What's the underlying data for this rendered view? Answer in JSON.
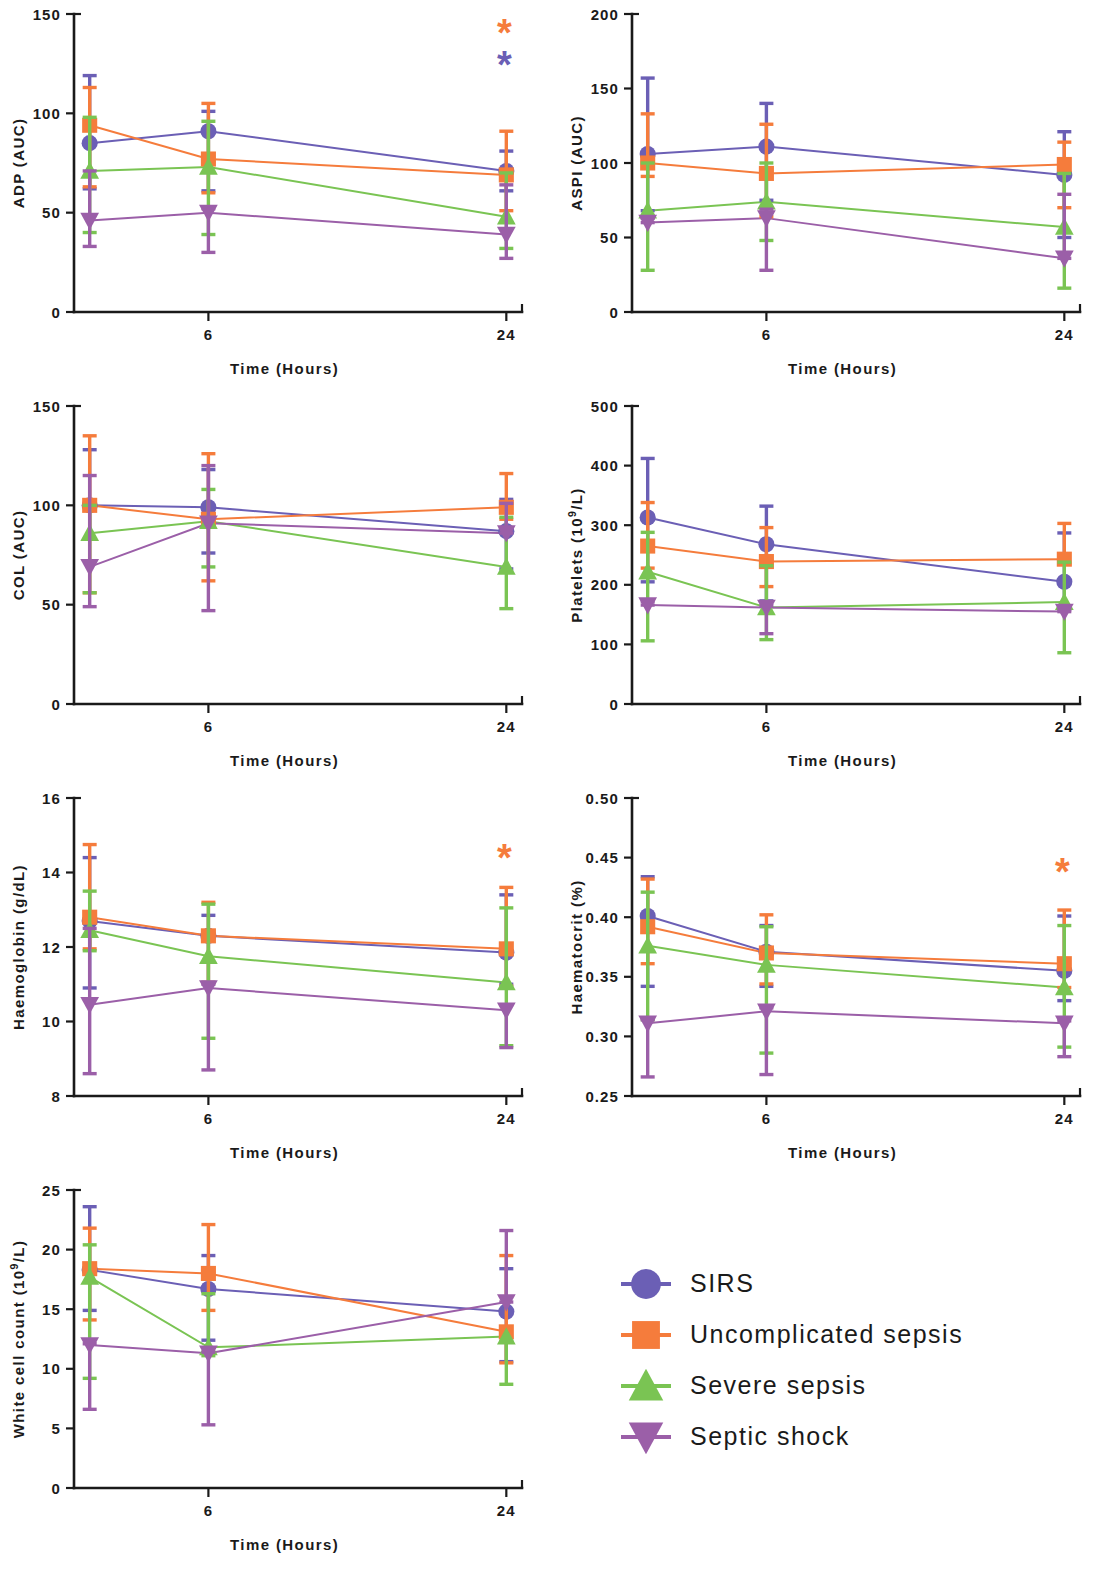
{
  "figure": {
    "panel_count": 7,
    "x_axis_title": "Time (Hours)",
    "x_tick_labels": [
      "6",
      "24"
    ]
  },
  "series_meta": [
    {
      "key": "sirs",
      "name": "SIRS",
      "color": "#6b5fb5",
      "marker": "circle"
    },
    {
      "key": "uncomplicated",
      "name": "Uncomplicated sepsis",
      "color": "#f57c3c",
      "marker": "square"
    },
    {
      "key": "severe",
      "name": "Severe sepsis",
      "color": "#7ac453",
      "marker": "triangle-up"
    },
    {
      "key": "shock",
      "name": "Septic shock",
      "color": "#9b5fa8",
      "marker": "triangle-down"
    }
  ],
  "legend": {
    "items": [
      {
        "label": "SIRS",
        "color": "#6b5fb5",
        "marker": "circle"
      },
      {
        "label": "Uncomplicated sepsis",
        "color": "#f57c3c",
        "marker": "square"
      },
      {
        "label": "Severe sepsis",
        "color": "#7ac453",
        "marker": "triangle-up"
      },
      {
        "label": "Septic shock",
        "color": "#9b5fa8",
        "marker": "triangle-down"
      }
    ]
  },
  "chart_data": [
    {
      "id": "adp",
      "type": "line",
      "position": {
        "left": 0,
        "top": 0
      },
      "title": "",
      "ylabel": "ADP (AUC)",
      "xlabel": "Time (Hours)",
      "ylim": [
        0,
        150
      ],
      "yticks": [
        0,
        50,
        100,
        150
      ],
      "ytick_labels": [
        "0",
        "50",
        "100",
        "150"
      ],
      "x": [
        0,
        6,
        24
      ],
      "xticks": [
        6,
        24
      ],
      "xtick_labels": [
        "6",
        "24"
      ],
      "grid": false,
      "annotations": [
        {
          "text": "*",
          "color": "#f57c3c",
          "x": 24,
          "y": 140
        },
        {
          "text": "*",
          "color": "#6b5fb5",
          "x": 24,
          "y": 124
        }
      ],
      "series": [
        {
          "name": "SIRS",
          "color": "#6b5fb5",
          "marker": "circle",
          "values": [
            85,
            91,
            71
          ],
          "err_low": [
            62,
            61,
            61
          ],
          "err_high": [
            119,
            101,
            81
          ]
        },
        {
          "name": "Uncomplicated sepsis",
          "color": "#f57c3c",
          "marker": "square",
          "values": [
            94,
            77,
            69
          ],
          "err_low": [
            63,
            60,
            51
          ],
          "err_high": [
            113,
            105,
            91
          ]
        },
        {
          "name": "Severe sepsis",
          "color": "#7ac453",
          "marker": "triangle-up",
          "values": [
            71,
            73,
            48
          ],
          "err_low": [
            40,
            39,
            32
          ],
          "err_high": [
            98,
            96,
            70
          ]
        },
        {
          "name": "Septic shock",
          "color": "#9b5fa8",
          "marker": "triangle-down",
          "values": [
            46,
            50,
            39
          ],
          "err_low": [
            33,
            30,
            27
          ],
          "err_high": [
            71,
            52,
            64
          ]
        }
      ]
    },
    {
      "id": "aspi",
      "type": "line",
      "position": {
        "left": 558,
        "top": 0
      },
      "title": "",
      "ylabel": "ASPI (AUC)",
      "xlabel": "Time (Hours)",
      "ylim": [
        0,
        200
      ],
      "yticks": [
        0,
        50,
        100,
        150,
        200
      ],
      "ytick_labels": [
        "0",
        "50",
        "100",
        "150",
        "200"
      ],
      "x": [
        0,
        6,
        24
      ],
      "xticks": [
        6,
        24
      ],
      "xtick_labels": [
        "6",
        "24"
      ],
      "grid": false,
      "annotations": [],
      "series": [
        {
          "name": "SIRS",
          "color": "#6b5fb5",
          "marker": "circle",
          "values": [
            106,
            111,
            92
          ],
          "err_low": [
            68,
            75,
            50
          ],
          "err_high": [
            157,
            140,
            121
          ]
        },
        {
          "name": "Uncomplicated sepsis",
          "color": "#f57c3c",
          "marker": "square",
          "values": [
            100,
            93,
            99
          ],
          "err_low": [
            91,
            64,
            70
          ],
          "err_high": [
            133,
            126,
            114
          ]
        },
        {
          "name": "Severe sepsis",
          "color": "#7ac453",
          "marker": "triangle-up",
          "values": [
            68,
            74,
            57
          ],
          "err_low": [
            28,
            48,
            16
          ],
          "err_high": [
            100,
            100,
            93
          ]
        },
        {
          "name": "Septic shock",
          "color": "#9b5fa8",
          "marker": "triangle-down",
          "values": [
            60,
            63,
            36
          ],
          "err_low": [
            60,
            28,
            36
          ],
          "err_high": [
            63,
            69,
            79
          ]
        }
      ]
    },
    {
      "id": "col",
      "type": "line",
      "position": {
        "left": 0,
        "top": 392
      },
      "title": "",
      "ylabel": "COL (AUC)",
      "xlabel": "Time (Hours)",
      "ylim": [
        0,
        150
      ],
      "yticks": [
        0,
        50,
        100,
        150
      ],
      "ytick_labels": [
        "0",
        "50",
        "100",
        "150"
      ],
      "x": [
        0,
        6,
        24
      ],
      "xticks": [
        6,
        24
      ],
      "xtick_labels": [
        "6",
        "24"
      ],
      "grid": false,
      "annotations": [],
      "series": [
        {
          "name": "SIRS",
          "color": "#6b5fb5",
          "marker": "circle",
          "values": [
            100,
            99,
            87
          ],
          "err_low": [
            83,
            76,
            68
          ],
          "err_high": [
            128,
            118,
            103
          ]
        },
        {
          "name": "Uncomplicated sepsis",
          "color": "#f57c3c",
          "marker": "square",
          "values": [
            100,
            93,
            99
          ],
          "err_low": [
            56,
            62,
            93
          ],
          "err_high": [
            135,
            126,
            116
          ]
        },
        {
          "name": "Severe sepsis",
          "color": "#7ac453",
          "marker": "triangle-up",
          "values": [
            86,
            92,
            69
          ],
          "err_low": [
            56,
            69,
            48
          ],
          "err_high": [
            100,
            108,
            94
          ]
        },
        {
          "name": "Septic shock",
          "color": "#9b5fa8",
          "marker": "triangle-down",
          "values": [
            69,
            91,
            86
          ],
          "err_low": [
            49,
            47,
            86
          ],
          "err_high": [
            115,
            120,
            101
          ]
        }
      ]
    },
    {
      "id": "platelets",
      "type": "line",
      "position": {
        "left": 558,
        "top": 392
      },
      "title": "",
      "ylabel": "Platelets (10⁹/L)",
      "ylabel_base": "Platelets (10",
      "ylabel_sup": "9",
      "ylabel_tail": "/L)",
      "xlabel": "Time (Hours)",
      "ylim": [
        0,
        500
      ],
      "yticks": [
        0,
        100,
        200,
        300,
        400,
        500
      ],
      "ytick_labels": [
        "0",
        "100",
        "200",
        "300",
        "400",
        "500"
      ],
      "x": [
        0,
        6,
        24
      ],
      "xticks": [
        6,
        24
      ],
      "xtick_labels": [
        "6",
        "24"
      ],
      "grid": false,
      "annotations": [],
      "series": [
        {
          "name": "SIRS",
          "color": "#6b5fb5",
          "marker": "circle",
          "values": [
            313,
            268,
            205
          ],
          "err_low": [
            205,
            173,
            163
          ],
          "err_high": [
            412,
            332,
            287
          ]
        },
        {
          "name": "Uncomplicated sepsis",
          "color": "#f57c3c",
          "marker": "square",
          "values": [
            265,
            239,
            243
          ],
          "err_low": [
            228,
            197,
            235
          ],
          "err_high": [
            338,
            296,
            303
          ]
        },
        {
          "name": "Severe sepsis",
          "color": "#7ac453",
          "marker": "triangle-up",
          "values": [
            222,
            162,
            171
          ],
          "err_low": [
            106,
            108,
            86
          ],
          "err_high": [
            288,
            232,
            238
          ]
        },
        {
          "name": "Septic shock",
          "color": "#9b5fa8",
          "marker": "triangle-down",
          "values": [
            166,
            162,
            155
          ],
          "err_low": [
            166,
            118,
            155
          ],
          "err_high": [
            172,
            165,
            158
          ]
        }
      ]
    },
    {
      "id": "haemoglobin",
      "type": "line",
      "position": {
        "left": 0,
        "top": 784
      },
      "title": "",
      "ylabel": "Haemoglobin (g/dL)",
      "xlabel": "Time (Hours)",
      "ylim": [
        8,
        16
      ],
      "yticks": [
        8,
        10,
        12,
        14,
        16
      ],
      "ytick_labels": [
        "8",
        "10",
        "12",
        "14",
        "16"
      ],
      "x": [
        0,
        6,
        24
      ],
      "xticks": [
        6,
        24
      ],
      "xtick_labels": [
        "6",
        "24"
      ],
      "grid": false,
      "annotations": [
        {
          "text": "*",
          "color": "#f57c3c",
          "x": 24,
          "y": 14.35
        }
      ],
      "series": [
        {
          "name": "SIRS",
          "color": "#6b5fb5",
          "marker": "circle",
          "values": [
            12.7,
            12.3,
            11.85
          ],
          "err_low": [
            10.9,
            11.05,
            11.0
          ],
          "err_high": [
            14.4,
            12.85,
            13.4
          ]
        },
        {
          "name": "Uncomplicated sepsis",
          "color": "#f57c3c",
          "marker": "square",
          "values": [
            12.8,
            12.3,
            11.95
          ],
          "err_low": [
            11.95,
            11.05,
            10.95
          ],
          "err_high": [
            14.75,
            13.2,
            13.6
          ]
        },
        {
          "name": "Severe sepsis",
          "color": "#7ac453",
          "marker": "triangle-up",
          "values": [
            12.45,
            11.75,
            11.05
          ],
          "err_low": [
            11.9,
            9.55,
            9.35
          ],
          "err_high": [
            13.5,
            13.15,
            13.05
          ]
        },
        {
          "name": "Septic shock",
          "color": "#9b5fa8",
          "marker": "triangle-down",
          "values": [
            10.45,
            10.9,
            10.3
          ],
          "err_low": [
            8.6,
            8.7,
            9.3
          ],
          "err_high": [
            12.5,
            11.0,
            10.45
          ]
        }
      ]
    },
    {
      "id": "haematocrit",
      "type": "line",
      "position": {
        "left": 558,
        "top": 784
      },
      "title": "",
      "ylabel": "Haematocrit (%)",
      "xlabel": "Time (Hours)",
      "ylim": [
        0.25,
        0.5
      ],
      "yticks": [
        0.25,
        0.3,
        0.35,
        0.4,
        0.45,
        0.5
      ],
      "ytick_labels": [
        "0.25",
        "0.30",
        "0.35",
        "0.40",
        "0.45",
        "0.50"
      ],
      "x": [
        0,
        6,
        24
      ],
      "xticks": [
        6,
        24
      ],
      "xtick_labels": [
        "6",
        "24"
      ],
      "grid": false,
      "annotations": [
        {
          "text": "*",
          "color": "#f57c3c",
          "x": 24,
          "y": 0.437
        }
      ],
      "series": [
        {
          "name": "SIRS",
          "color": "#6b5fb5",
          "marker": "circle",
          "values": [
            0.401,
            0.371,
            0.355
          ],
          "err_low": [
            0.342,
            0.342,
            0.33
          ],
          "err_high": [
            0.434,
            0.393,
            0.401
          ]
        },
        {
          "name": "Uncomplicated sepsis",
          "color": "#f57c3c",
          "marker": "square",
          "values": [
            0.392,
            0.37,
            0.361
          ],
          "err_low": [
            0.361,
            0.344,
            0.341
          ],
          "err_high": [
            0.432,
            0.402,
            0.406
          ]
        },
        {
          "name": "Severe sepsis",
          "color": "#7ac453",
          "marker": "triangle-up",
          "values": [
            0.376,
            0.36,
            0.341
          ],
          "err_low": [
            0.314,
            0.286,
            0.291
          ],
          "err_high": [
            0.421,
            0.392,
            0.393
          ]
        },
        {
          "name": "Septic shock",
          "color": "#9b5fa8",
          "marker": "triangle-down",
          "values": [
            0.311,
            0.321,
            0.311
          ],
          "err_low": [
            0.266,
            0.268,
            0.283
          ],
          "err_high": [
            0.314,
            0.324,
            0.313
          ]
        }
      ]
    },
    {
      "id": "wcc",
      "type": "line",
      "position": {
        "left": 0,
        "top": 1176
      },
      "title": "",
      "ylabel": "White cell count (10⁹/L)",
      "ylabel_base": "White cell count (10",
      "ylabel_sup": "9",
      "ylabel_tail": "/L)",
      "xlabel": "Time (Hours)",
      "ylim": [
        0,
        25
      ],
      "yticks": [
        0,
        5,
        10,
        15,
        20,
        25
      ],
      "ytick_labels": [
        "0",
        "5",
        "10",
        "15",
        "20",
        "25"
      ],
      "x": [
        0,
        6,
        24
      ],
      "xticks": [
        6,
        24
      ],
      "xtick_labels": [
        "6",
        "24"
      ],
      "grid": false,
      "annotations": [],
      "series": [
        {
          "name": "SIRS",
          "color": "#6b5fb5",
          "marker": "circle",
          "values": [
            18.3,
            16.7,
            14.8
          ],
          "err_low": [
            14.9,
            12.4,
            10.6
          ],
          "err_high": [
            23.6,
            19.5,
            18.4
          ]
        },
        {
          "name": "Uncomplicated sepsis",
          "color": "#f57c3c",
          "marker": "square",
          "values": [
            18.4,
            18.0,
            13.1
          ],
          "err_low": [
            14.1,
            14.9,
            10.5
          ],
          "err_high": [
            21.8,
            22.1,
            19.5
          ]
        },
        {
          "name": "Severe sepsis",
          "color": "#7ac453",
          "marker": "triangle-up",
          "values": [
            17.7,
            11.8,
            12.7
          ],
          "err_low": [
            9.2,
            11.1,
            8.7
          ],
          "err_high": [
            20.4,
            16.3,
            12.3
          ]
        },
        {
          "name": "Septic shock",
          "color": "#9b5fa8",
          "marker": "triangle-down",
          "values": [
            12.0,
            11.3,
            15.6
          ],
          "err_low": [
            6.6,
            5.3,
            15.6
          ],
          "err_high": [
            12.1,
            11.4,
            21.6
          ]
        }
      ]
    }
  ]
}
